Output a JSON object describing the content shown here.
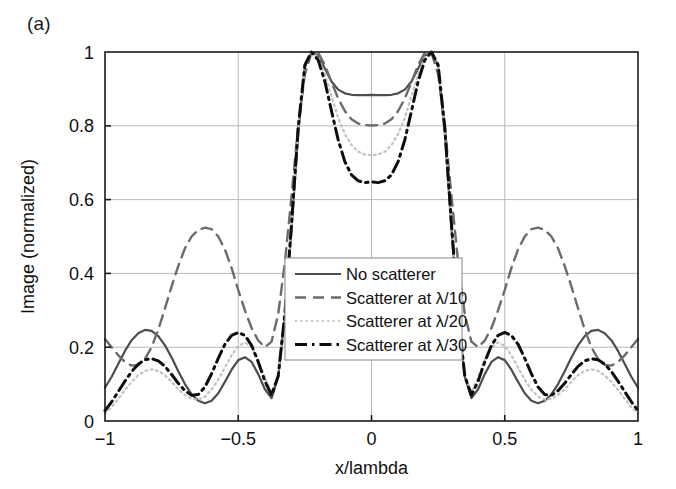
{
  "panel": {
    "label": "(a)"
  },
  "chart_data": {
    "type": "line",
    "title": "",
    "panel_label": "(a)",
    "xlabel": "x/lambda",
    "ylabel": "Image (normalized)",
    "xlim": [
      -1,
      1
    ],
    "ylim": [
      0,
      1
    ],
    "xticks": [
      -1,
      -0.5,
      0,
      0.5,
      1
    ],
    "xticklabels": [
      "−1",
      "−0.5",
      "0",
      "0.5",
      "1"
    ],
    "yticks": [
      0,
      0.2,
      0.4,
      0.6,
      0.8,
      1
    ],
    "yticklabels": [
      "0",
      "0.2",
      "0.4",
      "0.6",
      "0.8",
      "1"
    ],
    "grid": true,
    "grid_color": "#b9b9b9",
    "legend_position": "center",
    "frame_color": "#1a1a1a",
    "background": "#ffffff",
    "x": [
      -1,
      -0.975,
      -0.95,
      -0.925,
      -0.9,
      -0.875,
      -0.85,
      -0.825,
      -0.8,
      -0.775,
      -0.75,
      -0.725,
      -0.7,
      -0.675,
      -0.65,
      -0.625,
      -0.6,
      -0.575,
      -0.55,
      -0.525,
      -0.5,
      -0.475,
      -0.45,
      -0.425,
      -0.4,
      -0.375,
      -0.35,
      -0.325,
      -0.3,
      -0.275,
      -0.25,
      -0.225,
      -0.2,
      -0.175,
      -0.15,
      -0.125,
      -0.1,
      -0.075,
      -0.05,
      -0.025,
      0,
      0.025,
      0.05,
      0.075,
      0.1,
      0.125,
      0.15,
      0.175,
      0.2,
      0.225,
      0.25,
      0.275,
      0.3,
      0.325,
      0.35,
      0.375,
      0.4,
      0.425,
      0.45,
      0.475,
      0.5,
      0.525,
      0.55,
      0.575,
      0.6,
      0.625,
      0.65,
      0.675,
      0.7,
      0.725,
      0.75,
      0.775,
      0.8,
      0.825,
      0.85,
      0.875,
      0.9,
      0.925,
      0.95,
      0.975,
      1
    ],
    "series": [
      {
        "name": "No scatterer",
        "label": "No scatterer",
        "style": "solid",
        "color": "#4d4d4d",
        "width": 2.2,
        "values": [
          0.09,
          0.12,
          0.155,
          0.19,
          0.219,
          0.238,
          0.247,
          0.244,
          0.23,
          0.205,
          0.172,
          0.135,
          0.1,
          0.072,
          0.055,
          0.048,
          0.055,
          0.075,
          0.106,
          0.139,
          0.165,
          0.173,
          0.16,
          0.127,
          0.086,
          0.062,
          0.12,
          0.285,
          0.52,
          0.78,
          0.96,
          1.0,
          0.99,
          0.955,
          0.92,
          0.898,
          0.888,
          0.884,
          0.883,
          0.883,
          0.884,
          0.883,
          0.883,
          0.884,
          0.888,
          0.898,
          0.92,
          0.955,
          0.99,
          1.0,
          0.96,
          0.78,
          0.52,
          0.285,
          0.12,
          0.062,
          0.086,
          0.127,
          0.16,
          0.173,
          0.165,
          0.139,
          0.106,
          0.075,
          0.055,
          0.048,
          0.055,
          0.072,
          0.1,
          0.135,
          0.172,
          0.205,
          0.23,
          0.244,
          0.247,
          0.238,
          0.219,
          0.19,
          0.155,
          0.12,
          0.09
        ]
      },
      {
        "name": "Scatterer at λ/10",
        "label": "Scatterer at λ/10",
        "style": "dashed",
        "color": "#6b6b6b",
        "width": 2.4,
        "values": [
          0.222,
          0.2,
          0.178,
          0.16,
          0.15,
          0.152,
          0.168,
          0.2,
          0.248,
          0.305,
          0.365,
          0.42,
          0.468,
          0.5,
          0.518,
          0.524,
          0.52,
          0.5,
          0.465,
          0.415,
          0.355,
          0.3,
          0.252,
          0.218,
          0.2,
          0.215,
          0.29,
          0.43,
          0.61,
          0.8,
          0.94,
          0.998,
          0.998,
          0.965,
          0.918,
          0.874,
          0.84,
          0.818,
          0.806,
          0.802,
          0.801,
          0.802,
          0.806,
          0.818,
          0.84,
          0.874,
          0.918,
          0.965,
          0.998,
          0.998,
          0.94,
          0.8,
          0.61,
          0.43,
          0.29,
          0.215,
          0.2,
          0.218,
          0.252,
          0.3,
          0.355,
          0.415,
          0.465,
          0.5,
          0.52,
          0.524,
          0.518,
          0.5,
          0.468,
          0.42,
          0.365,
          0.305,
          0.248,
          0.2,
          0.168,
          0.152,
          0.15,
          0.16,
          0.178,
          0.2,
          0.222
        ]
      },
      {
        "name": "Scatterer at λ/20",
        "label": "Scatterer at λ/20",
        "style": "dotted",
        "color": "#c2c2c2",
        "width": 2.2,
        "values": [
          0.02,
          0.038,
          0.06,
          0.084,
          0.106,
          0.124,
          0.136,
          0.14,
          0.136,
          0.124,
          0.106,
          0.086,
          0.07,
          0.06,
          0.058,
          0.066,
          0.085,
          0.112,
          0.145,
          0.178,
          0.203,
          0.213,
          0.2,
          0.166,
          0.118,
          0.078,
          0.125,
          0.29,
          0.53,
          0.79,
          0.962,
          1.0,
          0.985,
          0.94,
          0.88,
          0.822,
          0.778,
          0.748,
          0.73,
          0.722,
          0.72,
          0.722,
          0.73,
          0.748,
          0.778,
          0.822,
          0.88,
          0.94,
          0.985,
          1.0,
          0.962,
          0.79,
          0.53,
          0.29,
          0.125,
          0.078,
          0.118,
          0.166,
          0.2,
          0.213,
          0.203,
          0.178,
          0.145,
          0.112,
          0.085,
          0.066,
          0.058,
          0.06,
          0.07,
          0.086,
          0.106,
          0.124,
          0.136,
          0.14,
          0.136,
          0.124,
          0.106,
          0.084,
          0.06,
          0.038,
          0.02
        ]
      },
      {
        "name": "Scatterer at λ/30",
        "label": "Scatterer at λ/30",
        "style": "dashdot",
        "color": "#0d0d0d",
        "width": 3.0,
        "values": [
          0.028,
          0.052,
          0.08,
          0.108,
          0.134,
          0.154,
          0.166,
          0.169,
          0.163,
          0.148,
          0.126,
          0.102,
          0.082,
          0.07,
          0.072,
          0.092,
          0.128,
          0.17,
          0.208,
          0.232,
          0.24,
          0.232,
          0.205,
          0.16,
          0.108,
          0.07,
          0.122,
          0.292,
          0.535,
          0.795,
          0.965,
          1.0,
          0.978,
          0.92,
          0.84,
          0.762,
          0.703,
          0.667,
          0.651,
          0.646,
          0.648,
          0.646,
          0.651,
          0.667,
          0.703,
          0.762,
          0.84,
          0.92,
          0.978,
          1.0,
          0.965,
          0.795,
          0.535,
          0.292,
          0.122,
          0.07,
          0.108,
          0.16,
          0.205,
          0.232,
          0.24,
          0.232,
          0.208,
          0.17,
          0.128,
          0.092,
          0.072,
          0.07,
          0.082,
          0.102,
          0.126,
          0.148,
          0.163,
          0.169,
          0.166,
          0.154,
          0.134,
          0.108,
          0.08,
          0.052,
          0.028
        ]
      }
    ]
  }
}
